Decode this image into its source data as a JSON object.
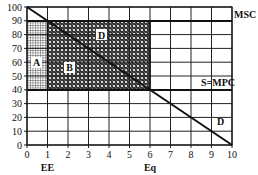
{
  "chart_data": {
    "type": "line",
    "title": "",
    "xlabel": "",
    "ylabel": "",
    "xlim": [
      0,
      10
    ],
    "ylim": [
      0,
      100
    ],
    "x_ticks": [
      0,
      1,
      2,
      3,
      4,
      5,
      6,
      7,
      8,
      9,
      10
    ],
    "y_ticks": [
      0,
      10,
      20,
      30,
      40,
      50,
      60,
      70,
      80,
      90,
      100
    ],
    "grid": true,
    "series": [
      {
        "name": "D",
        "x": [
          0,
          10
        ],
        "y": [
          100,
          0
        ]
      },
      {
        "name": "MSC",
        "x": [
          0,
          10
        ],
        "y": [
          90,
          90
        ]
      },
      {
        "name": "S=MPC",
        "x": [
          0,
          10
        ],
        "y": [
          40,
          40
        ]
      }
    ],
    "regions": [
      {
        "label": "A",
        "x": [
          0,
          1
        ],
        "y": [
          40,
          90
        ],
        "pattern": "fine-grid"
      },
      {
        "label": "B",
        "x": [
          1,
          6
        ],
        "y": [
          40,
          90
        ],
        "pattern": "crosshatch"
      }
    ],
    "annotations": [
      {
        "text": "D",
        "x": 5.1,
        "y": 78
      },
      {
        "text": "A",
        "x": 0.5,
        "y": 60
      },
      {
        "text": "B",
        "x": 3.0,
        "y": 52
      },
      {
        "text": "MSC",
        "x": 10.3,
        "y": 90
      },
      {
        "text": "S=MPC",
        "x": 8.5,
        "y": 42
      },
      {
        "text": "D",
        "x": 9.3,
        "y": 18
      }
    ],
    "x_markers": [
      {
        "text": "EE",
        "x": 1
      },
      {
        "text": "Eq",
        "x": 6
      }
    ]
  },
  "labels": {
    "msc": "MSC",
    "smpc": "S=MPC",
    "d_upper": "D",
    "d_lower": "D",
    "a": "A",
    "b": "B",
    "ee": "EE",
    "eq": "Eq"
  },
  "y_tick_labels": [
    "0",
    "10",
    "20",
    "30",
    "40",
    "50",
    "60",
    "70",
    "80",
    "90",
    "100"
  ],
  "x_tick_labels": [
    "0",
    "1",
    "2",
    "3",
    "4",
    "5",
    "6",
    "7",
    "8",
    "9",
    "10"
  ]
}
